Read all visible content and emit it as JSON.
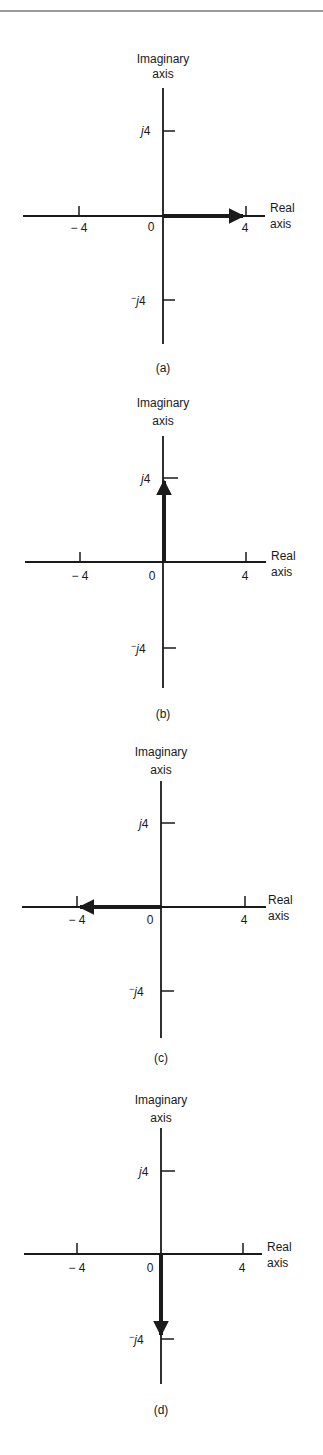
{
  "figure": {
    "panels": [
      {
        "id": "a",
        "caption": "(a)",
        "imag_axis_label_line1": "Imaginary",
        "imag_axis_label_line2": "axis",
        "real_axis_label_line1": "Real",
        "real_axis_label_line2": "axis",
        "tick_neg_real": "− 4",
        "tick_origin": "0",
        "tick_pos_real": "4",
        "tick_pos_imag_j": "j",
        "tick_pos_imag_num": "4",
        "tick_neg_imag_sign": "−",
        "tick_neg_imag_j": "j",
        "tick_neg_imag_num": "4",
        "phasor": {
          "real": 4,
          "imag": 0,
          "direction": "right"
        }
      },
      {
        "id": "b",
        "caption": "(b)",
        "imag_axis_label_line1": "Imaginary",
        "imag_axis_label_line2": "axis",
        "real_axis_label_line1": "Real",
        "real_axis_label_line2": "axis",
        "tick_neg_real": "− 4",
        "tick_origin": "0",
        "tick_pos_real": "4",
        "tick_pos_imag_j": "j",
        "tick_pos_imag_num": "4",
        "tick_neg_imag_sign": "−",
        "tick_neg_imag_j": "j",
        "tick_neg_imag_num": "4",
        "phasor": {
          "real": 0,
          "imag": 4,
          "direction": "up"
        }
      },
      {
        "id": "c",
        "caption": "(c)",
        "imag_axis_label_line1": "Imaginary",
        "imag_axis_label_line2": "axis",
        "real_axis_label_line1": "Real",
        "real_axis_label_line2": "axis",
        "tick_neg_real": "− 4",
        "tick_origin": "0",
        "tick_pos_real": "4",
        "tick_pos_imag_j": "j",
        "tick_pos_imag_num": "4",
        "tick_neg_imag_sign": "−",
        "tick_neg_imag_j": "j",
        "tick_neg_imag_num": "4",
        "phasor": {
          "real": -4,
          "imag": 0,
          "direction": "left"
        }
      },
      {
        "id": "d",
        "caption": "(d)",
        "imag_axis_label_line1": "Imaginary",
        "imag_axis_label_line2": "axis",
        "real_axis_label_line1": "Real",
        "real_axis_label_line2": "axis",
        "tick_neg_real": "− 4",
        "tick_origin": "0",
        "tick_pos_real": "4",
        "tick_pos_imag_j": "j",
        "tick_pos_imag_num": "4",
        "tick_neg_imag_sign": "−",
        "tick_neg_imag_j": "j",
        "tick_neg_imag_num": "4",
        "phasor": {
          "real": 0,
          "imag": -4,
          "direction": "down"
        }
      }
    ],
    "colors": {
      "ink": "#1a1a1a",
      "rule": "#9a9a9a",
      "background": "#ffffff"
    }
  }
}
